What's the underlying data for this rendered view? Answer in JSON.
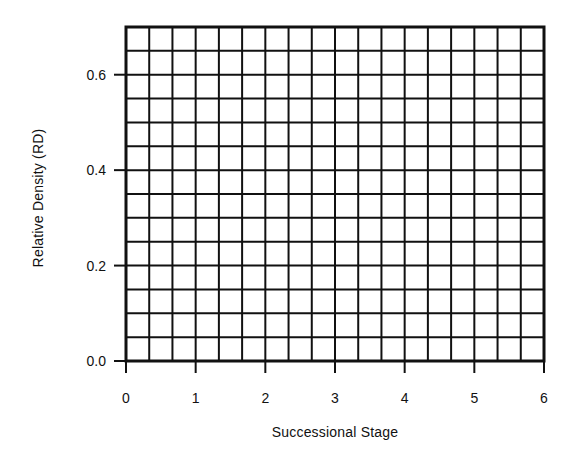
{
  "chart_data": {
    "type": "line",
    "title": "",
    "xlabel": "Successional Stage",
    "ylabel": "Relative Density (RD)",
    "xlim": [
      0,
      6
    ],
    "ylim": [
      0,
      0.7
    ],
    "x_ticks": [
      "0",
      "1",
      "2",
      "3",
      "4",
      "5",
      "6"
    ],
    "y_ticks": [
      "0.0",
      "0.2",
      "0.4",
      "0.6"
    ],
    "y_tick_values": [
      0,
      0.2,
      0.4,
      0.6
    ],
    "grid": true,
    "grid_columns": 18,
    "grid_rows": 14,
    "series": [],
    "legend": null
  },
  "colors": {
    "line": "#111111",
    "background": "#ffffff"
  }
}
